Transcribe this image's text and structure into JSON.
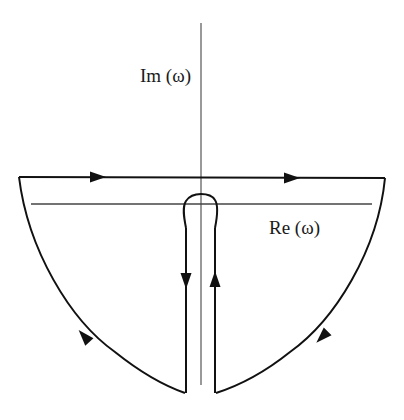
{
  "diagram": {
    "type": "contour-integration-diagram",
    "labels": {
      "imaginary_axis": "Im (ω)",
      "real_axis": "Re (ω)"
    },
    "colors": {
      "contour": "#111111",
      "axes": "#444444",
      "background": "#ffffff"
    },
    "contour_segments": [
      {
        "name": "top-horizontal-path",
        "direction": "left-to-right",
        "arrows": 2
      },
      {
        "name": "right-arc",
        "direction": "clockwise-down",
        "arrows": 1
      },
      {
        "name": "keyhole-right-leg",
        "direction": "up",
        "arrows": 1
      },
      {
        "name": "keyhole-loop",
        "direction": "over-origin"
      },
      {
        "name": "keyhole-left-leg",
        "direction": "down",
        "arrows": 1
      },
      {
        "name": "left-arc",
        "direction": "up-to-left-end",
        "arrows": 1
      }
    ]
  }
}
